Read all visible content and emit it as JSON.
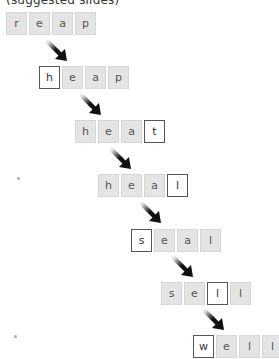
{
  "header": {
    "title": "(suggested slides)"
  },
  "colors": {
    "tile_bg": "#e4e4e4",
    "tile_border": "#d6d6d6",
    "changed_tile_bg": "#ffffff",
    "changed_tile_border": "#555555",
    "arrow": "#111111"
  },
  "steps": [
    {
      "word": "reap",
      "letters": [
        "r",
        "e",
        "a",
        "p"
      ],
      "changed_index": null
    },
    {
      "word": "heap",
      "letters": [
        "h",
        "e",
        "a",
        "p"
      ],
      "changed_index": 0
    },
    {
      "word": "heat",
      "letters": [
        "h",
        "e",
        "a",
        "t"
      ],
      "changed_index": 3
    },
    {
      "word": "heal",
      "letters": [
        "h",
        "e",
        "a",
        "l"
      ],
      "changed_index": 3
    },
    {
      "word": "seal",
      "letters": [
        "s",
        "e",
        "a",
        "l"
      ],
      "changed_index": 0
    },
    {
      "word": "sell",
      "letters": [
        "s",
        "e",
        "l",
        "l"
      ],
      "changed_index": 2
    },
    {
      "word": "well",
      "letters": [
        "w",
        "e",
        "l",
        "l"
      ],
      "changed_index": 0
    }
  ]
}
